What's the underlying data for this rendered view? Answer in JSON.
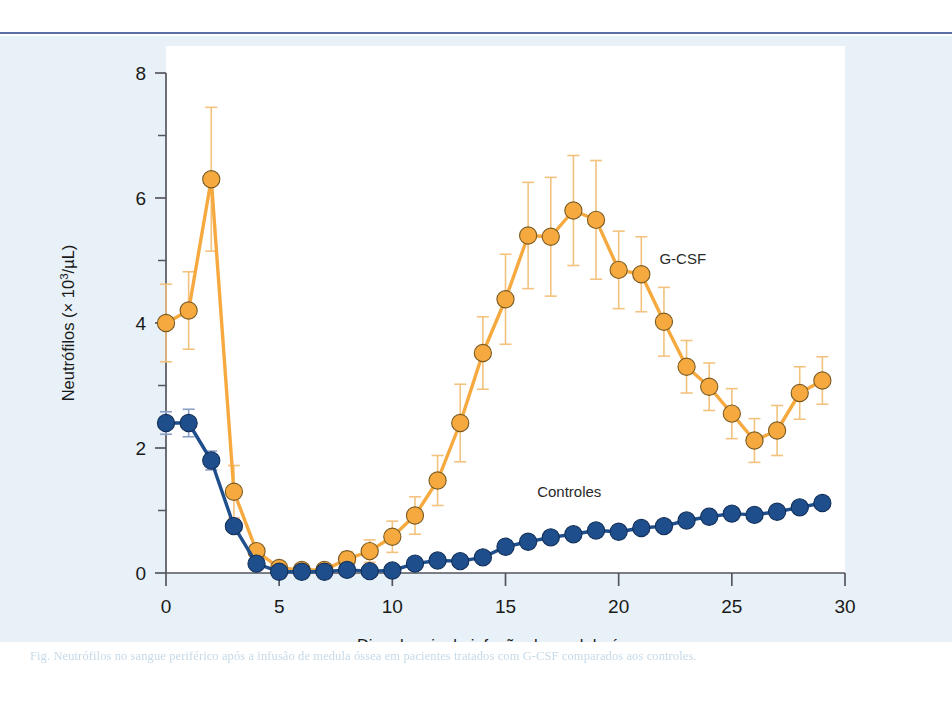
{
  "figure": {
    "background_color": "#e8f1f7",
    "plot_background_color": "#ffffff",
    "top_rule_color": "#5a6ea8",
    "caption": "Fig. Neutrófilos no sangue periférico após a infusão de medula óssea em pacientes tratados com G-CSF comparados aos controles."
  },
  "chart_data": {
    "type": "line",
    "title": "",
    "subtitle": "",
    "xlabel": "Dias depois da infusão de medula óssea",
    "ylabel": "Neutrófilos (× 10³/µL)",
    "ylabel_parts": {
      "main": "Neutrófilos (",
      "times": "×",
      "base": " 10",
      "exponent": "3",
      "unit": "/µL)"
    },
    "xlim": [
      0,
      30
    ],
    "ylim": [
      0,
      8
    ],
    "xticks": [
      0,
      5,
      10,
      15,
      20,
      25,
      30
    ],
    "xtick_labels": [
      "0",
      "5",
      "10",
      "15",
      "20",
      "25",
      "30"
    ],
    "yticks": [
      0,
      2,
      4,
      6,
      8
    ],
    "ytick_labels": [
      "0",
      "2",
      "4",
      "6",
      "8"
    ],
    "yminor_ticks": [
      1,
      3,
      5,
      7
    ],
    "grid": false,
    "legend_position": "inline-annotation",
    "x": [
      0,
      1,
      2,
      3,
      4,
      5,
      6,
      7,
      8,
      9,
      10,
      11,
      12,
      13,
      14,
      15,
      16,
      17,
      18,
      19,
      20,
      21,
      22,
      23,
      24,
      25,
      26,
      27,
      28,
      29
    ],
    "series": [
      {
        "name": "G-CSF",
        "color": "#F5A93F",
        "marker_edge_color": "#7a5a20",
        "label_x": 21.8,
        "label_y": 4.95,
        "values": [
          4.0,
          4.2,
          6.3,
          1.3,
          0.35,
          0.08,
          0.05,
          0.05,
          0.22,
          0.35,
          0.58,
          0.92,
          1.48,
          2.4,
          3.52,
          4.38,
          5.4,
          5.38,
          5.8,
          5.65,
          4.85,
          4.78,
          4.02,
          3.3,
          2.98,
          2.55,
          2.12,
          2.28,
          2.88,
          3.08
        ],
        "err": [
          0.62,
          0.62,
          1.15,
          0.42,
          0.1,
          0.05,
          0.05,
          0.05,
          0.12,
          0.18,
          0.25,
          0.3,
          0.4,
          0.62,
          0.58,
          0.72,
          0.85,
          0.95,
          0.88,
          0.95,
          0.62,
          0.6,
          0.55,
          0.42,
          0.38,
          0.4,
          0.35,
          0.4,
          0.42,
          0.38
        ]
      },
      {
        "name": "Controles",
        "color": "#1F4E8C",
        "marker_edge_color": "#12305a",
        "label_x": 16.4,
        "label_y": 1.22,
        "values": [
          2.4,
          2.4,
          1.8,
          0.75,
          0.15,
          0.02,
          0.02,
          0.02,
          0.05,
          0.03,
          0.04,
          0.15,
          0.2,
          0.19,
          0.25,
          0.42,
          0.5,
          0.57,
          0.62,
          0.68,
          0.66,
          0.72,
          0.75,
          0.84,
          0.9,
          0.95,
          0.93,
          0.98,
          1.05,
          1.12
        ],
        "err": [
          0.18,
          0.22,
          0.15,
          0.1,
          0.06,
          0.03,
          0.03,
          0.03,
          0.04,
          0.03,
          0.04,
          0.07,
          0.07,
          0.07,
          0.08,
          0.1,
          0.1,
          0.1,
          0.1,
          0.1,
          0.1,
          0.1,
          0.1,
          0.1,
          0.1,
          0.1,
          0.1,
          0.1,
          0.1,
          0.1
        ]
      }
    ]
  }
}
